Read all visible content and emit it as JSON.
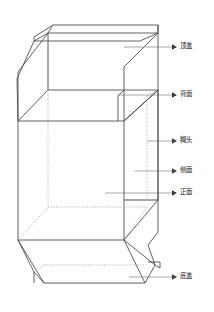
{
  "diagram": {
    "background_color": "#ffffff",
    "solid_edge_color": "#3a3a3a",
    "hidden_edge_color": "#9a9a9a",
    "leader_color": "#6b6b6b",
    "labels": [
      {
        "id": "top-lid",
        "text": "顶盖",
        "y": 47,
        "leader_from_x": 124,
        "leader_to_x": 172,
        "leader_y": 47
      },
      {
        "id": "back-face",
        "text": "背面",
        "y": 95,
        "leader_from_x": 118,
        "leader_to_x": 172,
        "leader_y": 95
      },
      {
        "id": "glue-flap",
        "text": "糊头",
        "y": 141,
        "leader_from_x": 147,
        "leader_to_x": 172,
        "leader_y": 141
      },
      {
        "id": "side-face",
        "text": "侧面",
        "y": 171,
        "leader_from_x": 135,
        "leader_to_x": 172,
        "leader_y": 171
      },
      {
        "id": "front-face",
        "text": "正面",
        "y": 193,
        "leader_from_x": 105,
        "leader_to_x": 172,
        "leader_y": 193
      },
      {
        "id": "bottom-lid",
        "text": "底盖",
        "y": 277,
        "leader_from_x": 129,
        "leader_to_x": 172,
        "leader_y": 277
      }
    ],
    "parts": [
      {
        "id": "top-lid-panel",
        "name": "顶盖"
      },
      {
        "id": "back-face-panel",
        "name": "背面"
      },
      {
        "id": "glue-flap-panel",
        "name": "糊头"
      },
      {
        "id": "side-face-panel",
        "name": "侧面"
      },
      {
        "id": "front-face-panel",
        "name": "正面"
      },
      {
        "id": "bottom-lid-panel",
        "name": "底盖"
      }
    ]
  }
}
